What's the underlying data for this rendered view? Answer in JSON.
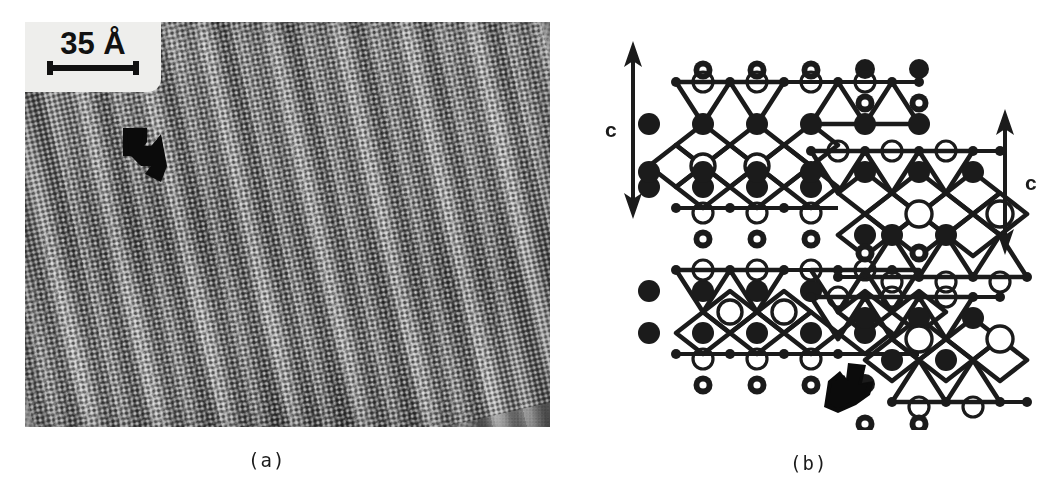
{
  "figure": {
    "panels": [
      {
        "id": "a",
        "caption": "(a)",
        "type": "hrtem-micrograph"
      },
      {
        "id": "b",
        "caption": "(b)",
        "type": "crystal-structure-model"
      }
    ]
  },
  "panel_a": {
    "caption": "(a)",
    "scale_bar": {
      "label": "35 Å",
      "value": "35",
      "unit": "Å",
      "plate_color": "#eeeeec",
      "bar_color": "#111111"
    },
    "annotation": {
      "marker": "black-arrow",
      "direction": "down-right",
      "meaning": "stacking fault / lamellar defect"
    },
    "image": {
      "description": "High-resolution transmission electron micrograph showing dotted lattice fringes with inclined banded contrast",
      "base_gray": "#8d8d8d",
      "fringe_angle_deg": 13
    }
  },
  "panel_b": {
    "caption": "(b)",
    "axis_arrows": [
      {
        "name": "left-c-axis",
        "label": "c",
        "label_side": "left",
        "orientation": "vertical-double-headed"
      },
      {
        "name": "right-c-axis",
        "label": "c",
        "label_side": "right",
        "orientation": "vertical-double-headed"
      }
    ],
    "annotation": {
      "marker": "black-arrow",
      "direction": "up-right",
      "meaning": "layer offset / stacking fault in the model"
    },
    "legend_symbols": [
      {
        "name": "filled-circle",
        "fill": "#1b1b1b",
        "meaning": "cation site (filled)"
      },
      {
        "name": "open-circle",
        "fill": "#ffffff",
        "stroke": "#1b1b1b",
        "meaning": "cation site (open)"
      },
      {
        "name": "donut-circle",
        "fill": "#1b1b1b",
        "center": "#ffffff",
        "meaning": "interlayer site"
      },
      {
        "name": "small-vertex-dot",
        "fill": "#1b1b1b",
        "meaning": "polyhedron vertex (anion)"
      }
    ],
    "structure": {
      "motif": "edge-sharing octahedral slabs with terminating tetrahedra",
      "slab_count": 4,
      "line_color": "#1b1b1b"
    }
  },
  "colors": {
    "ink": "#1b1b1b",
    "paper": "#ffffff",
    "micrograph_gray": "#8d8d8d"
  }
}
